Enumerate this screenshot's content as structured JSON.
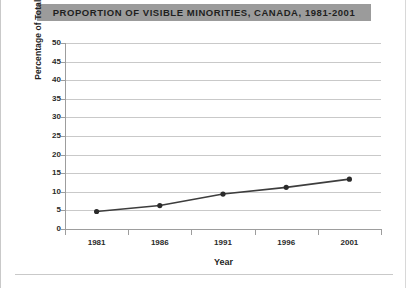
{
  "chart_data": {
    "type": "line",
    "title": "PROPORTION OF VISIBLE MINORITIES, CANADA, 1981-2001",
    "xlabel": "Year",
    "ylabel": "Percentage of Total Population (%)",
    "categories": [
      "1981",
      "1986",
      "1991",
      "1996",
      "2001"
    ],
    "values": [
      4.7,
      6.3,
      9.4,
      11.2,
      13.4
    ],
    "series": [
      {
        "name": "Proportion of visible minorities",
        "values": [
          4.7,
          6.3,
          9.4,
          11.2,
          13.4
        ]
      }
    ],
    "ylim": [
      0,
      50
    ],
    "ytick_labels": [
      "50",
      "45",
      "40",
      "35",
      "30",
      "25",
      "20",
      "15",
      "10",
      "5",
      "0"
    ],
    "ytick_values": [
      50,
      45,
      40,
      35,
      30,
      25,
      20,
      15,
      10,
      5,
      0
    ],
    "ystep": 5,
    "grid": true,
    "legend": "none",
    "marker": "circle",
    "colors": {
      "title_band": "#9b9b9b",
      "title_text": "#1f1f1f",
      "line": "#3d3d3d",
      "marker": "#2b2b2b",
      "gridline": "#c9c9c9",
      "axis": "#9d9d9d",
      "plot_background": "#ffffff",
      "figure_background": "#ffffff"
    }
  }
}
